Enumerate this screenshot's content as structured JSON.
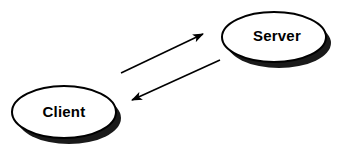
{
  "diagram": {
    "type": "client-server-communication",
    "background_color": "#ffffff",
    "stroke_color": "#000000",
    "fill_color": "#ffffff",
    "shadow_color": "#1a1a1a",
    "nodes": [
      {
        "id": "client",
        "label": "Client",
        "shape": "ellipse",
        "cx": 64,
        "cy": 112,
        "rx": 52,
        "ry": 26,
        "shadow_dx": 5,
        "shadow_dy": 6,
        "label_x": 64,
        "label_y": 112
      },
      {
        "id": "server",
        "label": "Server",
        "shape": "ellipse",
        "cx": 274,
        "cy": 37,
        "rx": 52,
        "ry": 25,
        "shadow_dx": 5,
        "shadow_dy": 6,
        "label_x": 277,
        "label_y": 36
      }
    ],
    "arrows": [
      {
        "id": "client-to-server",
        "label": "request",
        "from": "client",
        "to": "server",
        "x1": 121,
        "y1": 73,
        "x2": 203,
        "y2": 34,
        "head_at": "end"
      },
      {
        "id": "server-to-client",
        "label": "response",
        "from": "server",
        "to": "client",
        "x1": 220,
        "y1": 60,
        "x2": 132,
        "y2": 100,
        "head_at": "end"
      }
    ]
  }
}
